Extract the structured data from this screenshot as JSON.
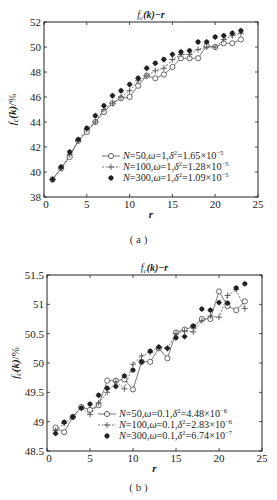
{
  "chart_data": [
    {
      "type": "line",
      "panel": "(a)",
      "title": "f_c(k)−r",
      "xlabel": "r",
      "ylabel": "f_c(k)/%",
      "xlim": [
        0,
        25
      ],
      "ylim": [
        38,
        52
      ],
      "xticks": [
        0,
        5,
        10,
        15,
        20,
        25
      ],
      "yticks": [
        38,
        40,
        42,
        44,
        46,
        48,
        50,
        52
      ],
      "grid": false,
      "legend_position": "lower right",
      "x": [
        1,
        2,
        3,
        4,
        5,
        6,
        7,
        8,
        9,
        10,
        11,
        12,
        13,
        14,
        15,
        16,
        17,
        18,
        19,
        20,
        21,
        22,
        23
      ],
      "series": [
        {
          "name": "N=50,ω=1,δ²=1.65×10⁻⁵",
          "marker": "circle",
          "values": [
            39.4,
            40.3,
            41.2,
            42.5,
            43.2,
            44.0,
            44.8,
            45.5,
            45.9,
            46.0,
            46.9,
            47.7,
            47.5,
            47.8,
            48.4,
            49.1,
            49.1,
            49.1,
            50.1,
            50.0,
            50.3,
            50.3,
            50.6
          ]
        },
        {
          "name": "N=100,ω=1,δ²=1.28×10⁻⁵",
          "marker": "plus",
          "values": [
            39.4,
            40.3,
            41.4,
            42.5,
            43.4,
            44.0,
            45.0,
            45.5,
            46.0,
            46.5,
            47.3,
            47.7,
            48.1,
            48.3,
            49.0,
            49.4,
            49.4,
            49.8,
            50.0,
            50.0,
            50.6,
            50.9,
            51.1
          ]
        },
        {
          "name": "N=300,ω=1,δ²=1.09×10⁻⁵",
          "marker": "star",
          "values": [
            39.4,
            40.4,
            41.6,
            42.6,
            43.5,
            44.5,
            45.3,
            46.1,
            46.5,
            47.0,
            47.5,
            48.3,
            48.7,
            49.0,
            49.4,
            49.6,
            49.7,
            50.4,
            50.4,
            50.8,
            50.9,
            51.1,
            51.3
          ]
        }
      ]
    },
    {
      "type": "line",
      "panel": "(b)",
      "title": "f_c(k)−r",
      "xlabel": "r",
      "ylabel": "f_c(k)/%",
      "xlim": [
        0,
        25
      ],
      "ylim": [
        48.5,
        51.5
      ],
      "xticks": [
        0,
        5,
        10,
        15,
        20,
        25
      ],
      "yticks": [
        48.5,
        49,
        49.5,
        50,
        50.5,
        51,
        51.5
      ],
      "grid": false,
      "legend_position": "lower right",
      "x": [
        1,
        2,
        3,
        4,
        5,
        6,
        7,
        8,
        9,
        10,
        11,
        12,
        13,
        14,
        15,
        16,
        17,
        18,
        19,
        20,
        21,
        22,
        23
      ],
      "series": [
        {
          "name": "N=50,ω=0.1,δ²=4.48×10⁻⁶",
          "marker": "circle",
          "values": [
            48.9,
            48.82,
            49.08,
            49.25,
            49.2,
            49.28,
            49.7,
            49.7,
            49.72,
            49.55,
            50.02,
            50.02,
            50.25,
            50.08,
            50.52,
            50.57,
            50.62,
            50.75,
            50.75,
            51.22,
            50.97,
            50.9,
            51.05
          ]
        },
        {
          "name": "N=100,ω=0.1,δ²=2.83×10⁻⁶",
          "marker": "plus",
          "values": [
            48.85,
            48.97,
            49.08,
            49.24,
            49.12,
            49.32,
            49.5,
            49.68,
            49.56,
            49.98,
            50.12,
            50.18,
            50.27,
            50.25,
            50.5,
            50.55,
            50.53,
            50.72,
            50.8,
            50.78,
            51.15,
            51.25,
            50.93
          ]
        },
        {
          "name": "N=300,ω=0.1,δ²=6.74×10⁻⁷",
          "marker": "star",
          "values": [
            48.8,
            48.99,
            49.08,
            49.23,
            49.3,
            49.45,
            49.57,
            49.6,
            49.78,
            49.88,
            50.02,
            50.2,
            50.27,
            50.25,
            50.43,
            50.45,
            50.63,
            50.92,
            50.9,
            51.03,
            51.02,
            51.28,
            51.35
          ]
        }
      ]
    }
  ],
  "panels": {
    "a": {
      "title_f": "f",
      "title_sub": "c",
      "title_rest": "(k)−r",
      "xlabel": "r",
      "caption": "( a )",
      "legend": [
        {
          "pre": "N",
          "mid": "=50,",
          "w": "ω",
          "wv": "=1,",
          "d": "δ",
          "dv": "=1.65×10",
          "exp": "−5"
        },
        {
          "pre": "N",
          "mid": "=100,",
          "w": "ω",
          "wv": "=1,",
          "d": "δ",
          "dv": "=1.28×10",
          "exp": "−5"
        },
        {
          "pre": "N",
          "mid": "=300,",
          "w": "ω",
          "wv": "=1,",
          "d": "δ",
          "dv": "=1.09×10",
          "exp": "−5"
        }
      ]
    },
    "b": {
      "title_f": "f",
      "title_sub": "c",
      "title_rest": "(k)−r",
      "xlabel": "r",
      "caption": "( b )",
      "legend": [
        {
          "pre": "N",
          "mid": "=50,",
          "w": "ω",
          "wv": "=0.1,",
          "d": "δ",
          "dv": "=4.48×10",
          "exp": "−6"
        },
        {
          "pre": "N",
          "mid": "=100,",
          "w": "ω",
          "wv": "=0.1,",
          "d": "δ",
          "dv": "=2.83×10",
          "exp": "−6"
        },
        {
          "pre": "N",
          "mid": "=300,",
          "w": "ω",
          "wv": "=0.1,",
          "d": "δ",
          "dv": "=6.74×10",
          "exp": "−7"
        }
      ]
    }
  },
  "colors": {
    "line": "#555555",
    "axis": "#222222",
    "marker_fill": "#ffffff",
    "star": "#222222"
  }
}
